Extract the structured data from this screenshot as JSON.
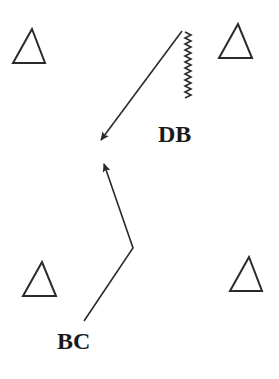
{
  "diagram": {
    "type": "play-diagram",
    "colors": {
      "stroke": "#2a2a2a",
      "background": "#ffffff"
    },
    "labels": [
      {
        "id": "db",
        "text": "DB",
        "x": 158,
        "y": 122
      },
      {
        "id": "bc",
        "text": "BC",
        "x": 57,
        "y": 329
      }
    ],
    "triangles": [
      {
        "id": "top-left",
        "points": "32,29 13,63 45,63"
      },
      {
        "id": "top-right",
        "points": "238,24 219,58 252,58"
      },
      {
        "id": "bottom-left",
        "points": "42,262 23,296 56,296"
      },
      {
        "id": "bottom-right",
        "points": "249,257 230,291 262,291"
      }
    ],
    "routes": [
      {
        "id": "db-route",
        "from": "DB",
        "points": "182,31 101,140"
      },
      {
        "id": "bc-route",
        "from": "BC",
        "points": "84,321 133,248 104,164"
      }
    ],
    "zigzag": {
      "id": "db-backpedal",
      "x": 188,
      "y_start": 32,
      "y_end": 100
    }
  }
}
